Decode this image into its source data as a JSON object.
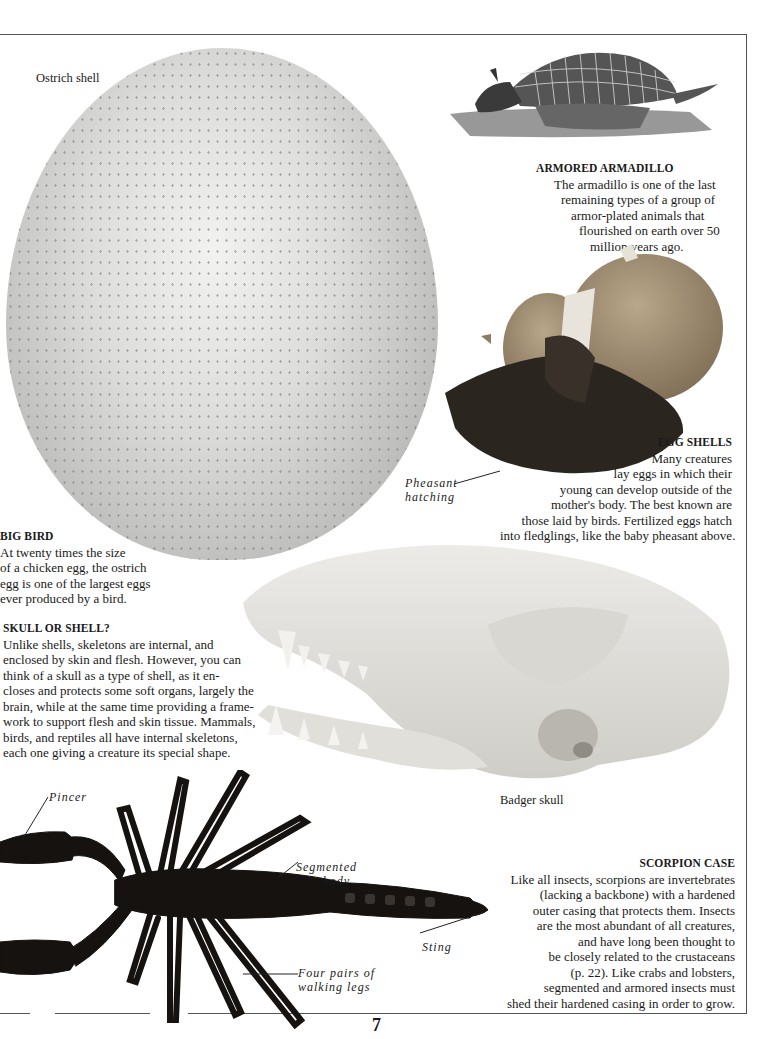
{
  "page": {
    "number": "7"
  },
  "labels": {
    "ostrich": "Ostrich shell",
    "badger": "Badger skull",
    "pheasant": [
      "Pheasant",
      "hatching"
    ],
    "pincer": "Pincer",
    "segmented": [
      "Segmented",
      "body"
    ],
    "sting": "Sting",
    "legs": [
      "Four pairs of",
      "walking legs"
    ]
  },
  "captions": {
    "armadillo": {
      "heading": "ARMORED ARMADILLO",
      "lines": [
        "The armadillo is one of the last",
        "remaining types of a group of",
        "armor-plated animals that",
        "flourished on earth over 50",
        "million years ago."
      ]
    },
    "eggshells": {
      "heading": "EGG SHELLS",
      "lines": [
        "Many creatures",
        "lay eggs in which their",
        "young can develop outside of the",
        "mother's body. The best known are",
        "those laid by birds. Fertilized eggs hatch",
        "into fledglings, like the baby pheasant above."
      ]
    },
    "bigbird": {
      "heading": "BIG BIRD",
      "lines": [
        "At twenty times the size",
        "of a chicken egg, the ostrich",
        "egg is one of the largest eggs",
        "ever produced by a bird."
      ]
    },
    "skull": {
      "heading": "SKULL OR SHELL?",
      "lines": [
        "Unlike shells, skeletons are internal, and",
        "enclosed by skin and flesh.  However, you can",
        "think of a skull as a type of shell, as it en-",
        "closes and protects some soft organs, largely the",
        "brain, while at the same time providing a frame-",
        "work to support flesh and skin tissue.  Mammals,",
        "birds, and reptiles all have internal skeletons,",
        "each one giving a creature its special shape."
      ]
    },
    "scorpion": {
      "heading": "SCORPION CASE",
      "lines": [
        "Like all insects, scorpions are invertebrates",
        "(lacking a backbone) with a hardened",
        "outer casing that protects them. Insects",
        "are the most abundant of all creatures,",
        "and have long been thought to",
        "be closely related to the crustaceans",
        "(p. 22). Like crabs and lobsters,",
        "segmented and armored insects must",
        "shed their hardened casing in order to grow."
      ]
    }
  }
}
